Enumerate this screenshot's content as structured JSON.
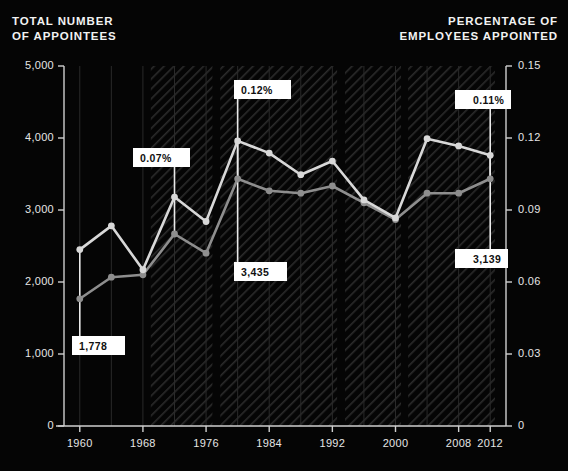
{
  "header": {
    "left_title": "TOTAL NUMBER\nOF APPOINTEES",
    "left_line1": "TOTAL NUMBER",
    "left_line2": "OF APPOINTEES",
    "right_line1": "PERCENTAGE OF",
    "right_line2": "EMPLOYEES APPOINTED"
  },
  "colors": {
    "background": "#050505",
    "appointees_line": "#d8d8d8",
    "percentage_line": "#8e8e8e",
    "axis": "#cfcfcf",
    "gridline": "#2a2a2a",
    "band_hatch": "#262626",
    "callout_bg": "#ffffff",
    "callout_text": "#101010"
  },
  "callouts": [
    {
      "id": "c-1778",
      "label": "1,778",
      "arrow": "right",
      "series": "appointees",
      "year": 1960
    },
    {
      "id": "c-007",
      "label": "0.07%",
      "arrow": "right",
      "series": "percentage",
      "year": 1972
    },
    {
      "id": "c-012",
      "label": "0.12%",
      "arrow": "right",
      "series": "percentage",
      "year": 1980
    },
    {
      "id": "c-3435",
      "label": "3,435",
      "arrow": "right",
      "series": "appointees",
      "year": 1980
    },
    {
      "id": "c-011",
      "label": "0.11%",
      "arrow": "left",
      "series": "percentage",
      "year": 2012
    },
    {
      "id": "c-3139",
      "label": "3,139",
      "arrow": "left",
      "series": "appointees",
      "year": 2012
    }
  ],
  "chart_data": {
    "type": "line",
    "title": "",
    "xlabel": "",
    "ylabel": "TOTAL NUMBER OF APPOINTEES",
    "y2label": "PERCENTAGE OF EMPLOYEES APPOINTED",
    "grid": true,
    "legend": "none",
    "x": [
      1960,
      1964,
      1968,
      1972,
      1976,
      1980,
      1984,
      1988,
      1992,
      1996,
      2000,
      2004,
      2008,
      2012
    ],
    "xlim": [
      1958,
      2014
    ],
    "xticks": [
      1960,
      1968,
      1976,
      1984,
      1992,
      2000,
      2008,
      2012
    ],
    "xticklabels": [
      "1960",
      "1968",
      "1976",
      "1984",
      "1992",
      "2000",
      "2008",
      "2012"
    ],
    "ylim": [
      0,
      5000
    ],
    "yticks": [
      0,
      1000,
      2000,
      3000,
      4000,
      5000
    ],
    "yticklabels": [
      "0",
      "1,000",
      "2,000",
      "3,000",
      "4,000",
      "5,000"
    ],
    "y2lim": [
      0,
      0.15
    ],
    "y2ticks": [
      0,
      0.03,
      0.06,
      0.09,
      0.12,
      0.15
    ],
    "y2ticklabels": [
      "0",
      "0.03",
      "0.06",
      "0.09",
      "0.12",
      "0.15"
    ],
    "series": [
      {
        "name": "Total number of appointees",
        "axis": "left",
        "color": "#d8d8d8",
        "values": [
          2450,
          2780,
          2170,
          3180,
          2840,
          3960,
          3790,
          3490,
          3680,
          3140,
          2890,
          3990,
          3890,
          3760
        ]
      },
      {
        "name": "Percentage of employees appointed",
        "axis": "right",
        "color": "#8e8e8e",
        "values": [
          0.053,
          0.062,
          0.063,
          0.08,
          0.072,
          0.103,
          0.098,
          0.097,
          0.1,
          0.093,
          0.086,
          0.097,
          0.097,
          0.103
        ]
      }
    ],
    "shaded_bands": [
      {
        "start": 1969.0,
        "end": 1976.8
      },
      {
        "start": 1977.8,
        "end": 1992.6
      },
      {
        "start": 1993.6,
        "end": 2000.7
      },
      {
        "start": 2001.6,
        "end": 2012.6
      }
    ],
    "annotations": [
      {
        "year": 1960,
        "value": 1778,
        "text": "1,778",
        "series": "appointees"
      },
      {
        "year": 1972,
        "value": 0.07,
        "text": "0.07%",
        "series": "percentage"
      },
      {
        "year": 1980,
        "value": 0.12,
        "text": "0.12%",
        "series": "percentage"
      },
      {
        "year": 1980,
        "value": 3435,
        "text": "3,435",
        "series": "appointees"
      },
      {
        "year": 2012,
        "value": 0.11,
        "text": "0.11%",
        "series": "percentage"
      },
      {
        "year": 2012,
        "value": 3139,
        "text": "3,139",
        "series": "appointees"
      }
    ]
  }
}
